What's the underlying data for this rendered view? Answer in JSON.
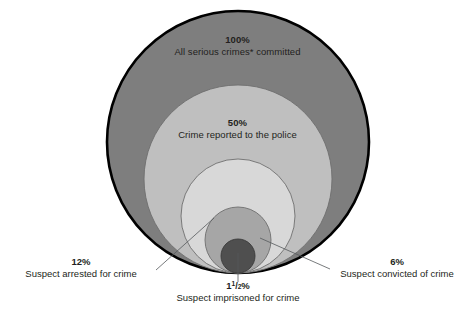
{
  "chart_data": {
    "type": "pie",
    "title": "",
    "subtitle": "",
    "xlabel": "",
    "ylabel": "",
    "grid": false,
    "legend_position": "none",
    "diagram_style": "nested-proportional-circles",
    "note": "Nested circles tangent at bottom; area proportional to percentage of all serious crimes committed",
    "categories": [
      "All serious crimes* committed",
      "Crime reported to the police",
      "Suspect arrested for crime",
      "Suspect convicted of crime",
      "Suspect imprisoned for crime"
    ],
    "values": [
      100,
      50,
      12,
      6,
      1.5
    ],
    "value_labels": [
      "100%",
      "50%",
      "12%",
      "6%",
      "1½%"
    ],
    "series": [
      {
        "name": "Percent of all serious crimes",
        "values": [
          100,
          50,
          12,
          6,
          1.5
        ]
      }
    ]
  },
  "circles": [
    {
      "id": "crimes-committed",
      "percent_label": "100%",
      "description": "All serious crimes* committed",
      "value": 100,
      "fill": "#7e7e7e",
      "stroke": "#000000",
      "stroke_width": 2.6,
      "radius": 131,
      "center_x": 238,
      "center_y": 142,
      "label_placement": "inside"
    },
    {
      "id": "crime-reported",
      "percent_label": "50%",
      "description": "Crime reported to the police",
      "value": 50,
      "fill": "#bfbfbf",
      "stroke": "#6e6e6e",
      "stroke_width": 0.9,
      "radius": 94,
      "center_x": 238,
      "center_y": 179,
      "label_placement": "inside"
    },
    {
      "id": "suspect-arrested",
      "percent_label": "12%",
      "description": "Suspect arrested for crime",
      "value": 12,
      "fill": "#d8d8d8",
      "stroke": "#6e6e6e",
      "stroke_width": 0.9,
      "radius": 57,
      "center_x": 238,
      "center_y": 216,
      "label_placement": "callout-left"
    },
    {
      "id": "suspect-convicted",
      "percent_label": "6%",
      "description": "Suspect convicted of crime",
      "value": 6,
      "fill": "#a6a6a6",
      "stroke": "#6e6e6e",
      "stroke_width": 0.9,
      "radius": 33,
      "center_x": 238,
      "center_y": 240,
      "label_placement": "callout-right"
    },
    {
      "id": "suspect-imprisoned",
      "percent_label": "1½%",
      "description": "Suspect imprisoned for crime",
      "value": 1.5,
      "fill": "#4f4f4f",
      "stroke": "#3a3a3a",
      "stroke_width": 0.9,
      "radius": 17,
      "center_x": 238,
      "center_y": 256,
      "label_placement": "callout-bottom"
    }
  ],
  "labels": {
    "outer": {
      "percent": "100%",
      "description": "All serious crimes* committed"
    },
    "reported": {
      "percent": "50%",
      "description": "Crime reported to the police"
    },
    "arrested": {
      "percent": "12%",
      "description": "Suspect arrested for crime"
    },
    "convicted": {
      "percent": "6%",
      "description": "Suspect convicted of crime"
    },
    "imprisoned": {
      "percent_whole": "1",
      "percent_num": "1",
      "percent_den": "2",
      "percent_sign": "%",
      "percent": "1½%",
      "description": "Suspect imprisoned for crime"
    }
  },
  "colors": {
    "background": "#ffffff",
    "text": "#231f20",
    "outer_fill": "#7e7e7e",
    "reported_fill": "#bfbfbf",
    "arrested_fill": "#d8d8d8",
    "convicted_fill": "#a6a6a6",
    "imprisoned_fill": "#4f4f4f",
    "outer_stroke": "#000000",
    "inner_stroke": "#6e6e6e",
    "leader_line": "#55595c"
  },
  "leader_lines": [
    {
      "name": "arrested-leader",
      "from_x": 156,
      "from_y": 270,
      "to_x": 214,
      "to_y": 218
    },
    {
      "name": "convicted-leader",
      "from_x": 330,
      "from_y": 269,
      "to_x": 260,
      "to_y": 238
    },
    {
      "name": "imprisoned-leader",
      "from_x": 238,
      "from_y": 282,
      "to_x": 238,
      "to_y": 253
    }
  ]
}
